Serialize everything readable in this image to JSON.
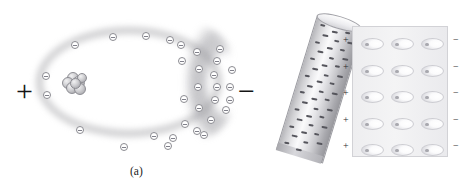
{
  "figure": {
    "background_color": "#ffffff"
  },
  "panel_a": {
    "caption": "(a)",
    "description": "Single atom polarized by an external field: electron cloud displaced toward the negative side",
    "left_sign": "+",
    "right_sign": "−",
    "electron_symbol": "⊖",
    "nucleus_label": "nucleus",
    "cloud_color": "#a8a8ac",
    "electron_border_color": "#8b8b91",
    "electron_count": 31,
    "nucleons": [
      {
        "x": 5,
        "y": 1,
        "d": 10
      },
      {
        "x": 0,
        "y": 6,
        "d": 10
      },
      {
        "x": 10,
        "y": 5,
        "d": 11
      },
      {
        "x": 4,
        "y": 11,
        "d": 10
      },
      {
        "x": 12,
        "y": 12,
        "d": 10
      },
      {
        "x": 15,
        "y": 2,
        "d": 8
      },
      {
        "x": 8,
        "y": 7,
        "d": 9
      }
    ],
    "electrons": [
      {
        "x": 109,
        "y": 33
      },
      {
        "x": 142,
        "y": 32
      },
      {
        "x": 166,
        "y": 36
      },
      {
        "x": 177,
        "y": 41
      },
      {
        "x": 71,
        "y": 41
      },
      {
        "x": 42,
        "y": 72
      },
      {
        "x": 43,
        "y": 91
      },
      {
        "x": 76,
        "y": 126
      },
      {
        "x": 120,
        "y": 143
      },
      {
        "x": 150,
        "y": 132
      },
      {
        "x": 169,
        "y": 134
      },
      {
        "x": 164,
        "y": 142
      },
      {
        "x": 193,
        "y": 48
      },
      {
        "x": 213,
        "y": 57
      },
      {
        "x": 195,
        "y": 65
      },
      {
        "x": 210,
        "y": 71
      },
      {
        "x": 194,
        "y": 83
      },
      {
        "x": 213,
        "y": 83
      },
      {
        "x": 226,
        "y": 83
      },
      {
        "x": 211,
        "y": 96
      },
      {
        "x": 195,
        "y": 104
      },
      {
        "x": 222,
        "y": 106
      },
      {
        "x": 207,
        "y": 116
      },
      {
        "x": 193,
        "y": 127
      },
      {
        "x": 228,
        "y": 66
      },
      {
        "x": 226,
        "y": 96
      },
      {
        "x": 216,
        "y": 45
      },
      {
        "x": 181,
        "y": 120
      },
      {
        "x": 178,
        "y": 57
      },
      {
        "x": 180,
        "y": 95
      },
      {
        "x": 200,
        "y": 131
      }
    ]
  },
  "panel_b": {
    "caption": "(b)",
    "description": "Negatively charged rod polarizes the atoms of a nearby dielectric slab",
    "rod": {
      "label": "charged rod",
      "charge_symbol": "−",
      "tilt_degrees": 17,
      "dash_count": 44,
      "dash_color": "#55555c"
    },
    "slab": {
      "label": "dielectric slab",
      "rows": 5,
      "columns": 3,
      "atom_symbol": "polarized-atom",
      "left_edge_signs": [
        "+",
        "+",
        "+",
        "+",
        "+"
      ],
      "right_edge_signs": [
        "−",
        "−",
        "−",
        "−",
        "−"
      ],
      "fill_color": "#f1f1f3",
      "border_color": "#d2d2d6"
    }
  }
}
